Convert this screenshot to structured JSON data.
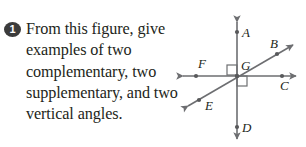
{
  "question": {
    "number": "1",
    "lines": [
      "From this figure, give",
      "examples of two",
      "complementary, two",
      "supplementary, and two",
      "vertical angles."
    ],
    "full_text": "From this figure, give examples of two complementary, two supplementary, and two vertical angles."
  },
  "figure": {
    "labels": {
      "a": "A",
      "b": "B",
      "c": "C",
      "d": "D",
      "e": "E",
      "f": "F",
      "g": "G"
    },
    "colors": {
      "line": "#6d6e71",
      "label": "#231f20",
      "badge_background": "#3b3b3b",
      "badge_text": "#ffffff",
      "page_background": "#ffffff"
    },
    "right_angle_marks": 2
  }
}
